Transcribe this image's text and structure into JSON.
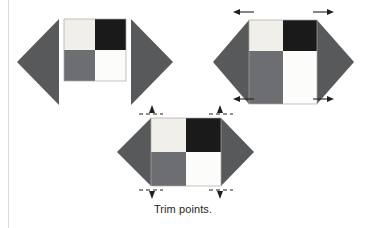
{
  "figure": {
    "caption": "Trim points.",
    "colors": {
      "triangle_gray": "#58595b",
      "patch_black": "#1a1a1a",
      "patch_light": "#f0efea",
      "patch_white": "#fcfcfa",
      "patch_gray": "#6d6e71",
      "outline": "#9a9a9a",
      "arrow": "#231f20",
      "rule": "#d9dcdf",
      "background": "#ffffff"
    },
    "steps": [
      {
        "id": "step-1",
        "name": "separated-triangles-and-square",
        "label": "",
        "patches": [
          {
            "position": "top-left",
            "fill": "#f0efea"
          },
          {
            "position": "top-right",
            "fill": "#1a1a1a"
          },
          {
            "position": "bottom-left",
            "fill": "#6d6e71"
          },
          {
            "position": "bottom-right",
            "fill": "#fcfcfa"
          }
        ],
        "triangles": [
          {
            "position": "left",
            "points": "right"
          },
          {
            "position": "right",
            "points": "right"
          }
        ]
      },
      {
        "id": "step-2",
        "name": "joined-unit-with-overhang-arrows",
        "label": "",
        "patches": [
          {
            "position": "top-left",
            "fill": "#f0efea"
          },
          {
            "position": "top-right",
            "fill": "#1a1a1a"
          },
          {
            "position": "bottom-left",
            "fill": "#6d6e71"
          },
          {
            "position": "bottom-right",
            "fill": "#fcfcfa"
          }
        ],
        "arrows": [
          {
            "id": "arrow-top-left",
            "direction": "left"
          },
          {
            "id": "arrow-top-right",
            "direction": "right"
          },
          {
            "id": "arrow-bottom-left",
            "direction": "left"
          },
          {
            "id": "arrow-bottom-right",
            "direction": "right"
          }
        ]
      },
      {
        "id": "step-3",
        "name": "trimmed-unit-with-trim-point-markers",
        "label": "",
        "patches": [
          {
            "position": "top-left",
            "fill": "#f0efea"
          },
          {
            "position": "top-right",
            "fill": "#1a1a1a"
          },
          {
            "position": "bottom-left",
            "fill": "#6d6e71"
          },
          {
            "position": "bottom-right",
            "fill": "#fcfcfa"
          }
        ],
        "markers": [
          {
            "id": "trim-marker-top-left",
            "type": "dashed-line-with-pointer"
          },
          {
            "id": "trim-marker-top-right",
            "type": "dashed-line-with-pointer"
          },
          {
            "id": "trim-marker-bottom-left",
            "type": "dashed-line-with-pointer"
          },
          {
            "id": "trim-marker-bottom-right",
            "type": "dashed-line-with-pointer"
          }
        ]
      }
    ]
  }
}
